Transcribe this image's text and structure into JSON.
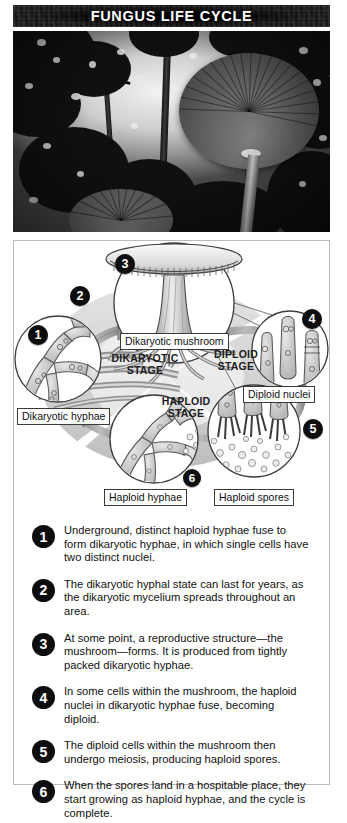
{
  "header": {
    "title": "FUNGUS LIFE CYCLE",
    "banner_bg": "#1a1a1a",
    "banner_text_color": "#ffffff"
  },
  "photo": {
    "alt": "Two mushrooms photographed from below against a forest canopy",
    "style": "black-and-white"
  },
  "diagram": {
    "stages": [
      {
        "line1": "DIKARYOTIC",
        "line2": "STAGE"
      },
      {
        "line1": "DIPLOID",
        "line2": "STAGE"
      },
      {
        "line1": "HAPLOID",
        "line2": "STAGE"
      }
    ],
    "callouts": [
      {
        "label": "Dikaryotic mushroom"
      },
      {
        "label": "Diploid nuclei"
      },
      {
        "label": "Dikaryotic hyphae"
      },
      {
        "label": "Haploid hyphae"
      },
      {
        "label": "Haploid spores"
      }
    ],
    "markers": [
      {
        "number": "1"
      },
      {
        "number": "2"
      },
      {
        "number": "3"
      },
      {
        "number": "4"
      },
      {
        "number": "5"
      },
      {
        "number": "6"
      }
    ]
  },
  "steps": [
    {
      "number": "1",
      "text": "Underground, distinct haploid hyphae fuse to form dikaryotic hyphae, in which single cells have two distinct nuclei."
    },
    {
      "number": "2",
      "text": "The dikaryotic hyphal state can last for years, as the dikaryotic mycelium spreads throughout an area."
    },
    {
      "number": "3",
      "text": "At some point, a reproductive structure—the mushroom—forms. It is produced from tightly packed dikaryotic hyphae."
    },
    {
      "number": "4",
      "text": "In some cells within the mushroom, the haploid nuclei in dikaryotic hyphae fuse, becoming diploid."
    },
    {
      "number": "5",
      "text": "The diploid cells within the mushroom then undergo meiosis, producing haploid spores."
    },
    {
      "number": "6",
      "text": "When the spores land in a hospitable place, they start growing as haploid hyphae, and the cycle is complete."
    }
  ]
}
